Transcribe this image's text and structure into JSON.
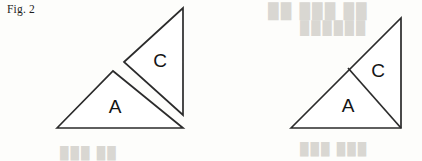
{
  "figure": {
    "caption": "Fig. 2",
    "background_color": "#fdfdfb",
    "stroke_color": "#2b2b2b",
    "fill_color": "#ffffff",
    "label_color": "#141414",
    "ghost_color": "#d9d7d2"
  },
  "diagram": {
    "type": "geometric-dissection",
    "panels": [
      {
        "name": "exploded-view",
        "description": "Triangle pieces A and C shown separated",
        "pieces": [
          {
            "label": "A",
            "shape": "triangle",
            "points": "57,128 113,71 183,128",
            "label_x": 115,
            "label_y": 108
          },
          {
            "label": "C",
            "shape": "triangle",
            "points": "124,62 183,8 183,115",
            "label_x": 160,
            "label_y": 62
          }
        ]
      },
      {
        "name": "assembled-view",
        "description": "Pieces A and C joined into one right triangle",
        "outline": {
          "shape": "right-triangle",
          "points": "291,128 401,18 401,128"
        },
        "divider": {
          "shape": "line",
          "x1": 348,
          "y1": 68,
          "x2": 401,
          "y2": 128
        },
        "pieces": [
          {
            "label": "A",
            "label_x": 348,
            "label_y": 107
          },
          {
            "label": "C",
            "label_x": 378,
            "label_y": 72
          }
        ]
      }
    ]
  },
  "artifacts": {
    "bleed_through": [
      {
        "id": "ghost-a",
        "text": "██ ███ ██"
      },
      {
        "id": "ghost-b",
        "text": "██████"
      },
      {
        "id": "ghost-c",
        "text": "███ ███"
      },
      {
        "id": "ghost-d",
        "text": "███ ██"
      }
    ]
  }
}
